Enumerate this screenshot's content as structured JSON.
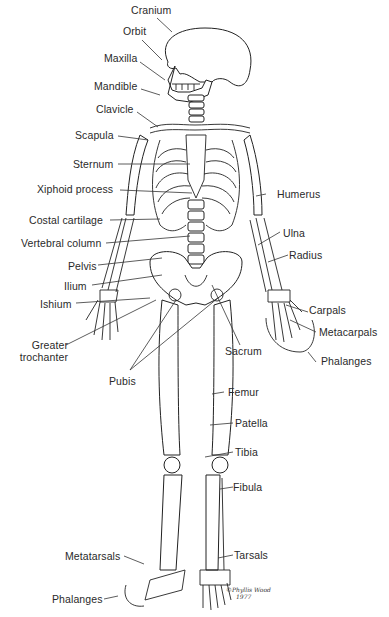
{
  "diagram": {
    "signature": {
      "line1": "©Phyllis Wood",
      "line2": "1977"
    },
    "labels_left": [
      {
        "id": "cranium",
        "text": "Cranium"
      },
      {
        "id": "orbit",
        "text": "Orbit"
      },
      {
        "id": "maxilla",
        "text": "Maxilla"
      },
      {
        "id": "mandible",
        "text": "Mandible"
      },
      {
        "id": "clavicle",
        "text": "Clavicle"
      },
      {
        "id": "scapula",
        "text": "Scapula"
      },
      {
        "id": "sternum",
        "text": "Sternum"
      },
      {
        "id": "xiphoid",
        "text": "Xiphoid process"
      },
      {
        "id": "costal",
        "text": "Costal cartilage"
      },
      {
        "id": "vertebral",
        "text": "Vertebral column"
      },
      {
        "id": "pelvis",
        "text": "Pelvis"
      },
      {
        "id": "ilium",
        "text": "Ilium"
      },
      {
        "id": "ishium",
        "text": "Ishium"
      },
      {
        "id": "greater1",
        "text": "Greater"
      },
      {
        "id": "greater2",
        "text": "trochanter"
      },
      {
        "id": "pubis",
        "text": "Pubis"
      },
      {
        "id": "metatarsals",
        "text": "Metatarsals"
      },
      {
        "id": "phalanges_foot",
        "text": "Phalanges"
      }
    ],
    "labels_right": [
      {
        "id": "humerus",
        "text": "Humerus"
      },
      {
        "id": "ulna",
        "text": "Ulna"
      },
      {
        "id": "radius",
        "text": "Radius"
      },
      {
        "id": "carpals",
        "text": "Carpals"
      },
      {
        "id": "metacarpals",
        "text": "Metacarpals"
      },
      {
        "id": "phalanges_hand",
        "text": "Phalanges"
      },
      {
        "id": "sacrum",
        "text": "Sacrum"
      },
      {
        "id": "femur",
        "text": "Femur"
      },
      {
        "id": "patella",
        "text": "Patella"
      },
      {
        "id": "tibia",
        "text": "Tibia"
      },
      {
        "id": "fibula",
        "text": "Fibula"
      },
      {
        "id": "tarsals",
        "text": "Tarsals"
      }
    ]
  }
}
